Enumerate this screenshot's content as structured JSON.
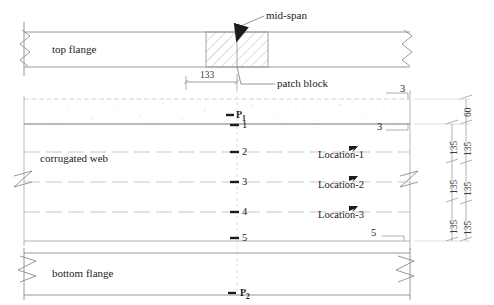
{
  "drawing": {
    "title": "Corrugated web girder elevation with patch block at mid-span",
    "units": "mm",
    "annotations": {
      "mid_span": "mid-span",
      "patch_block": "patch block",
      "top_flange": "top flange",
      "corrugated_web": "corrugated web",
      "bottom_flange": "bottom flange"
    },
    "dimensions": {
      "horizontal": [
        {
          "value": "133",
          "label": "133"
        }
      ],
      "vertical_inner": [
        {
          "value": "60",
          "label": "60"
        },
        {
          "value": "135",
          "label": "135"
        },
        {
          "value": "135",
          "label": "135"
        },
        {
          "value": "135",
          "label": "135"
        }
      ],
      "vertical_outer": [
        {
          "value": "135",
          "label": "135"
        },
        {
          "value": "135",
          "label": "135"
        },
        {
          "value": "135",
          "label": "135"
        }
      ]
    },
    "gauge_points": [
      {
        "label": "P",
        "subscript": "1",
        "name": "p1"
      },
      {
        "label": "1",
        "name": "point-1"
      },
      {
        "label": "2",
        "name": "point-2"
      },
      {
        "label": "3",
        "name": "point-3"
      },
      {
        "label": "4",
        "name": "point-4"
      },
      {
        "label": "5",
        "name": "point-5"
      },
      {
        "label": "P",
        "subscript": "2",
        "name": "p2"
      }
    ],
    "locations": [
      {
        "label": "Location-1"
      },
      {
        "label": "Location-2"
      },
      {
        "label": "Location-3"
      }
    ],
    "edge_callouts": [
      {
        "label": "3",
        "name": "callout-3-upper"
      },
      {
        "label": "3",
        "name": "callout-3-lower"
      },
      {
        "label": "5",
        "name": "callout-5"
      }
    ],
    "colors": {
      "line": "#3c3c3c",
      "thin_line": "#9a9a9a",
      "dashed": "#b8b8b8",
      "hatch": "#c9c9c9",
      "text": "#1c1c1c"
    }
  }
}
